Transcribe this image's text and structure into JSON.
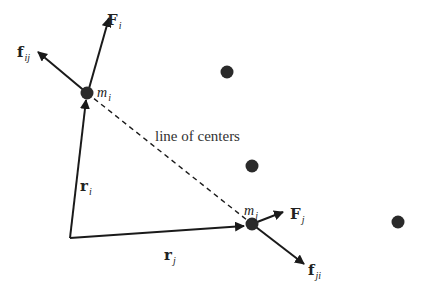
{
  "diagram": {
    "colors": {
      "line": "#1a1a1a",
      "dot": "#2a2a2a",
      "text": "#222222"
    },
    "particles": {
      "mi": {
        "label_base": "m",
        "label_sub": "i"
      },
      "mj": {
        "label_base": "m",
        "label_sub": "j"
      }
    },
    "vectors": {
      "Fi": {
        "label_base": "F",
        "label_sub": "i"
      },
      "fij": {
        "label_base": "f",
        "label_sub": "ij"
      },
      "Fj": {
        "label_base": "F",
        "label_sub": "j"
      },
      "fji": {
        "label_base": "f",
        "label_sub": "ji"
      },
      "ri": {
        "label_base": "r",
        "label_sub": "i"
      },
      "rj": {
        "label_base": "r",
        "label_sub": "j"
      }
    },
    "annotation": {
      "line_of_centers": "line of centers"
    },
    "other_particles_count": 3
  }
}
